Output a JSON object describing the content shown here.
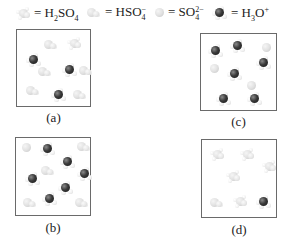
{
  "legend": [
    {
      "id": "h2so4",
      "icon": "h2so4-molecule-icon",
      "text_main": "= H",
      "sub1": "2",
      "text_mid": "SO",
      "sub2": "4",
      "sup": "",
      "left": 16
    },
    {
      "id": "hso4",
      "icon": "hso4-ion-icon",
      "text_main": "= HSO",
      "sub1": "",
      "text_mid": "",
      "sub2": "4",
      "sup": "−",
      "left": 87
    },
    {
      "id": "so4",
      "icon": "so4-ion-icon",
      "text_main": "= SO",
      "sub1": "",
      "text_mid": "",
      "sub2": "4",
      "sup": "2−",
      "left": 155
    },
    {
      "id": "h3o",
      "icon": "h3o-ion-icon",
      "text_main": "= H",
      "sub1": "3",
      "text_mid": "O",
      "sub2": "",
      "sup": "+",
      "left": 212
    }
  ],
  "legend_labels": {
    "h2so4": "H2SO4",
    "hso4": "HSO4−",
    "so4": "SO4 2−",
    "h3o": "H3O+"
  },
  "panels": [
    {
      "id": "a",
      "label": "(a)",
      "left": 16,
      "top": 29,
      "width": 75,
      "height": 78,
      "label_top": 110,
      "molecules": [
        {
          "type": "hso4",
          "x": 27,
          "y": 10
        },
        {
          "type": "h2so4",
          "x": 50,
          "y": 7
        },
        {
          "type": "h3o",
          "x": 9,
          "y": 23
        },
        {
          "type": "hso4",
          "x": 21,
          "y": 37
        },
        {
          "type": "h3o",
          "x": 45,
          "y": 33
        },
        {
          "type": "hso4",
          "x": 62,
          "y": 36
        },
        {
          "type": "hso4",
          "x": 9,
          "y": 56
        },
        {
          "type": "h3o",
          "x": 34,
          "y": 58
        },
        {
          "type": "hso4",
          "x": 56,
          "y": 60
        }
      ]
    },
    {
      "id": "c",
      "label": "(c)",
      "left": 200,
      "top": 33,
      "width": 77,
      "height": 78,
      "label_top": 114,
      "molecules": [
        {
          "type": "h3o",
          "x": 7,
          "y": 10
        },
        {
          "type": "h3o",
          "x": 29,
          "y": 5
        },
        {
          "type": "so4",
          "x": 61,
          "y": 9
        },
        {
          "type": "so4",
          "x": 9,
          "y": 30
        },
        {
          "type": "h3o",
          "x": 55,
          "y": 22
        },
        {
          "type": "h3o",
          "x": 26,
          "y": 33
        },
        {
          "type": "so4",
          "x": 46,
          "y": 47
        },
        {
          "type": "h3o",
          "x": 15,
          "y": 58
        },
        {
          "type": "h3o",
          "x": 46,
          "y": 58
        }
      ]
    },
    {
      "id": "b",
      "label": "(b)",
      "left": 15,
      "top": 137,
      "width": 76,
      "height": 79,
      "label_top": 220,
      "molecules": [
        {
          "type": "so4",
          "x": 6,
          "y": 5
        },
        {
          "type": "h3o",
          "x": 24,
          "y": 4
        },
        {
          "type": "hso4",
          "x": 61,
          "y": 4
        },
        {
          "type": "h3o",
          "x": 44,
          "y": 17
        },
        {
          "type": "hso4",
          "x": 25,
          "y": 28
        },
        {
          "type": "h3o",
          "x": 9,
          "y": 34
        },
        {
          "type": "h3o",
          "x": 61,
          "y": 29
        },
        {
          "type": "h3o",
          "x": 42,
          "y": 43
        },
        {
          "type": "h3o",
          "x": 26,
          "y": 54
        },
        {
          "type": "hso4",
          "x": 7,
          "y": 60
        },
        {
          "type": "hso4",
          "x": 59,
          "y": 60
        }
      ]
    },
    {
      "id": "d",
      "label": "(d)",
      "left": 201,
      "top": 139,
      "width": 76,
      "height": 79,
      "label_top": 222,
      "molecules": [
        {
          "type": "h2so4",
          "x": 8,
          "y": 8
        },
        {
          "type": "h2so4",
          "x": 38,
          "y": 8
        },
        {
          "type": "h2so4",
          "x": 60,
          "y": 20
        },
        {
          "type": "h2so4",
          "x": 24,
          "y": 30
        },
        {
          "type": "hso4",
          "x": 8,
          "y": 58
        },
        {
          "type": "h2so4",
          "x": 31,
          "y": 55
        },
        {
          "type": "h3o",
          "x": 54,
          "y": 55
        }
      ]
    }
  ]
}
